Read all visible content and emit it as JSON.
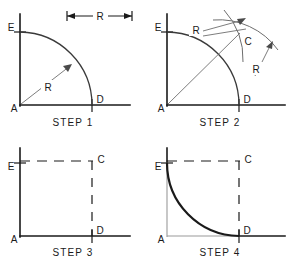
{
  "figure": {
    "background_color": "#ffffff",
    "ink_color": "#1a1a1a",
    "construction_color": "#6e6e6e"
  },
  "dimension_bar": {
    "label": "R",
    "left_arrow": "arrow-left",
    "right_arrow": "arrow-right"
  },
  "steps": [
    {
      "id": "step1",
      "caption": "STEP 1",
      "points": [
        {
          "name": "A",
          "label": "A"
        },
        {
          "name": "E",
          "label": "E"
        },
        {
          "name": "D",
          "label": "D"
        }
      ],
      "dimensions": [
        {
          "name": "radius-A",
          "label": "R"
        }
      ]
    },
    {
      "id": "step2",
      "caption": "STEP 2",
      "points": [
        {
          "name": "A",
          "label": "A"
        },
        {
          "name": "E",
          "label": "E"
        },
        {
          "name": "D",
          "label": "D"
        },
        {
          "name": "C",
          "label": "C"
        }
      ],
      "dimensions": [
        {
          "name": "radius-from-E",
          "label": "R"
        },
        {
          "name": "radius-from-D",
          "label": "R"
        }
      ]
    },
    {
      "id": "step3",
      "caption": "STEP 3",
      "points": [
        {
          "name": "A",
          "label": "A"
        },
        {
          "name": "E",
          "label": "E"
        },
        {
          "name": "C",
          "label": "C"
        },
        {
          "name": "D",
          "label": "D"
        }
      ],
      "dimensions": []
    },
    {
      "id": "step4",
      "caption": "STEP 4",
      "points": [
        {
          "name": "A",
          "label": "A"
        },
        {
          "name": "E",
          "label": "E"
        },
        {
          "name": "C",
          "label": "C"
        },
        {
          "name": "D",
          "label": "D"
        }
      ],
      "dimensions": []
    }
  ]
}
